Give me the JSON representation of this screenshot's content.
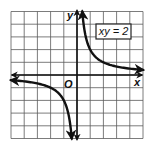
{
  "chart_data": {
    "type": "line",
    "title": "",
    "equation_label": "xy = 2",
    "function": "y = 2/x",
    "xlabel": "x",
    "ylabel": "y",
    "origin_label": "O",
    "xlim": [
      -5,
      5
    ],
    "ylim": [
      -5,
      5
    ],
    "grid": true,
    "grid_step": 1,
    "series": [
      {
        "name": "xy = 2 (Quadrant I branch)",
        "x": [
          0.4,
          0.5,
          0.75,
          1,
          1.5,
          2,
          3,
          4,
          5
        ],
        "y": [
          5,
          4,
          2.67,
          2,
          1.33,
          1,
          0.67,
          0.5,
          0.4
        ]
      },
      {
        "name": "xy = 2 (Quadrant III branch)",
        "x": [
          -5,
          -4,
          -3,
          -2,
          -1.5,
          -1,
          -0.75,
          -0.5,
          -0.4
        ],
        "y": [
          -0.4,
          -0.5,
          -0.67,
          -1,
          -1.33,
          -2,
          -2.67,
          -4,
          -5
        ]
      }
    ],
    "legend": {
      "position": "top-right",
      "entries": [
        "xy = 2"
      ]
    }
  },
  "labels": {
    "x_axis": "x",
    "y_axis": "y",
    "origin": "O",
    "equation": "xy = 2"
  },
  "colors": {
    "curve": "#111111",
    "axis": "#111111",
    "grid": "#5a5a5a",
    "background": "#ffffff"
  }
}
